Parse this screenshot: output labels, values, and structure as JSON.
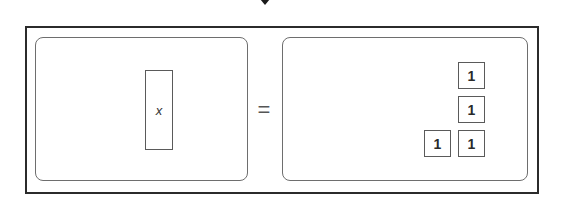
{
  "diagram": {
    "type": "algebra-tiles-equation",
    "top_arrow": {
      "icon": "arrow-down-icon",
      "color": "#1a1a1a"
    },
    "left_side": {
      "tiles": [
        {
          "kind": "variable",
          "label": "x"
        }
      ]
    },
    "equals": "=",
    "right_side": {
      "tiles": [
        {
          "kind": "unit",
          "label": "1"
        },
        {
          "kind": "unit",
          "label": "1"
        },
        {
          "kind": "unit",
          "label": "1"
        },
        {
          "kind": "unit",
          "label": "1"
        }
      ]
    },
    "equation": "x = 4",
    "colors": {
      "frame": "#2b2b2b",
      "panel_border": "#6e6e6e",
      "tile_border": "#5a5a5a",
      "background": "#ffffff"
    }
  }
}
